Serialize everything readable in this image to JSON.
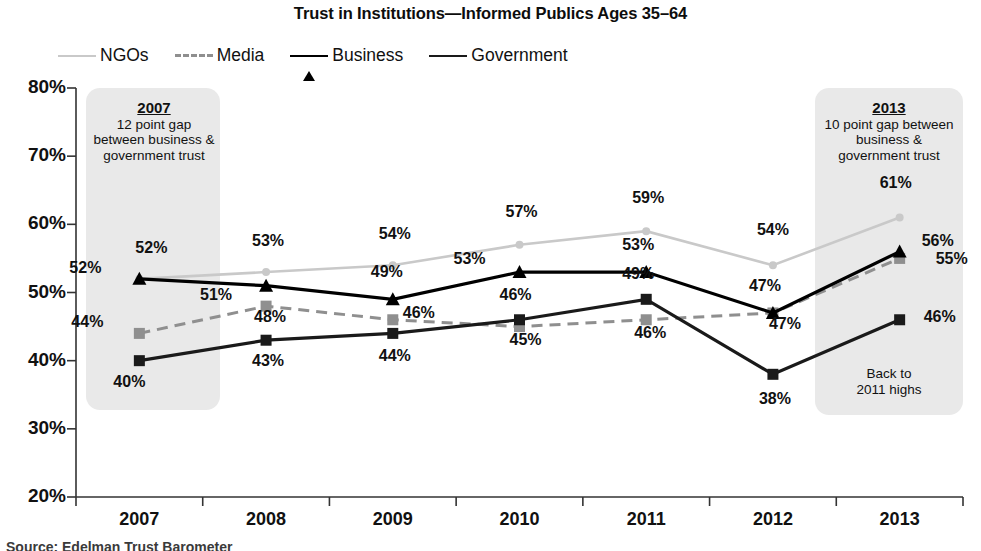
{
  "chart_data": {
    "type": "line",
    "title": "Trust in Institutions—Informed Publics Ages 35–64",
    "xlabel": "",
    "ylabel": "",
    "x": [
      "2007",
      "2008",
      "2009",
      "2010",
      "2011",
      "2012",
      "2013"
    ],
    "categories": [
      "2007",
      "2008",
      "2009",
      "2010",
      "2011",
      "2012",
      "2013"
    ],
    "ylim": [
      20,
      80
    ],
    "ytick_labels": [
      "80%",
      "70%",
      "60%",
      "50%",
      "40%",
      "30%",
      "20%"
    ],
    "ytick_values": [
      80,
      70,
      60,
      50,
      40,
      30,
      20
    ],
    "grid": false,
    "legend_position": "top-left",
    "series": [
      {
        "name": "NGOs",
        "color": "#c9c9c9",
        "style": "solid",
        "marker": "dot",
        "values": [
          52,
          53,
          54,
          57,
          59,
          54,
          61
        ],
        "labels": [
          "52%",
          "53%",
          "54%",
          "57%",
          "59%",
          "54%",
          "61%"
        ]
      },
      {
        "name": "Media",
        "color": "#8f8f8f",
        "style": "dashed",
        "marker": "square",
        "values": [
          44,
          48,
          46,
          45,
          46,
          47,
          55
        ],
        "labels": [
          "44%",
          "48%",
          "46%",
          "45%",
          "46%",
          "47%",
          "55%"
        ]
      },
      {
        "name": "Business",
        "color": "#000000",
        "style": "solid",
        "marker": "triangle",
        "values": [
          52,
          51,
          49,
          53,
          53,
          47,
          56
        ],
        "labels": [
          "52%",
          "51%",
          "49%",
          "53%",
          "53%",
          "47%",
          "56%"
        ]
      },
      {
        "name": "Government",
        "color": "#1a1a1a",
        "style": "solid",
        "marker": "square",
        "values": [
          40,
          43,
          44,
          46,
          49,
          38,
          46
        ],
        "labels": [
          "40%",
          "43%",
          "44%",
          "46%",
          "49%",
          "38%",
          "46%"
        ]
      }
    ],
    "annotations": [
      {
        "id": "band-2007",
        "header": "2007",
        "text": "12 point gap between business & government trust"
      },
      {
        "id": "band-2013",
        "header": "2013",
        "text": "10 point gap between business & government trust"
      },
      {
        "id": "note-2013",
        "header": "",
        "text": "Back to 2011 highs"
      }
    ]
  },
  "legend": {
    "items": [
      {
        "label": "NGOs"
      },
      {
        "label": "Media"
      },
      {
        "label": "Business"
      },
      {
        "label": "Government"
      }
    ]
  },
  "annotations": {
    "band_2007": {
      "header": "2007",
      "line1": "12 point gap",
      "line2": "between business &",
      "line3": "government trust"
    },
    "band_2013": {
      "header": "2013",
      "line1": "10 point gap between",
      "line2": "business &",
      "line3": "government trust"
    },
    "note_2013": {
      "line1": "Back to",
      "line2": "2011 highs"
    }
  },
  "source_strip": {
    "text": "Source: Edelman Trust Barometer"
  }
}
